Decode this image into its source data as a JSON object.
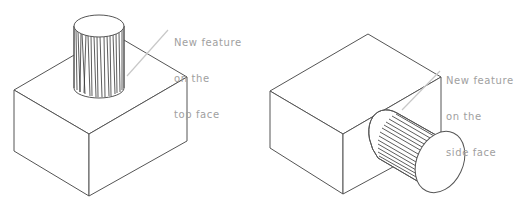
{
  "figure": {
    "panels": [
      {
        "id": "top-face",
        "description": "Block with cylindrical feature on top face",
        "callout": {
          "lines": [
            "New feature",
            "on the",
            "top face"
          ]
        }
      },
      {
        "id": "side-face",
        "description": "Block with cylindrical feature on side face",
        "callout": {
          "lines": [
            "New feature",
            "on the",
            "side face"
          ]
        }
      }
    ],
    "colors": {
      "edge": "#555555",
      "hatch": "#333333",
      "leader": "#c8c8c8",
      "label": "#a0a0a0"
    }
  }
}
